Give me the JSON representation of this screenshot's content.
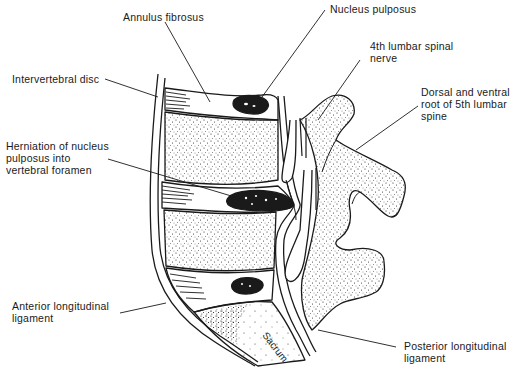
{
  "figure": {
    "type": "anatomical-line-drawing"
  },
  "labels": {
    "annulus_fibrosus": "Annulus fibrosus",
    "nucleus_pulposus": "Nucleus pulposus",
    "intervertebral_disc": "Intervertebral disc",
    "fourth_lumbar_nerve": "4th lumbar spinal\nnerve",
    "dorsal_ventral_root": "Dorsal and ventral\nroot of 5th lumbar\nspine",
    "herniation": "Herniation of nucleus\npulposus into\nvertebral foramen",
    "anterior_ligament": "Anterior longitudinal\nligament",
    "posterior_ligament": "Posterior longitudinal\nligament",
    "sacrum": "Sacrum"
  },
  "colors": {
    "ink": "#1a1a1a",
    "background": "#ffffff"
  }
}
